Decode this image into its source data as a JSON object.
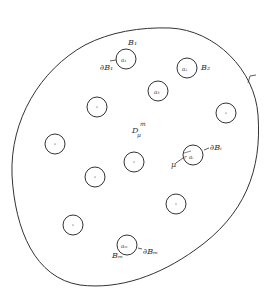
{
  "diagram": {
    "region_label": "D",
    "region_superscript": "m",
    "region_subscript": "μ",
    "boundary_label": "Γ",
    "inclusions": [
      {
        "id": "1",
        "cx": 126,
        "cy": 59,
        "center_label": "a₁",
        "ball_label": "B₁",
        "boundary_label": "∂B₁"
      },
      {
        "id": "2",
        "cx": 187,
        "cy": 68,
        "center_label": "a₂",
        "ball_label": "B₂"
      },
      {
        "id": "3",
        "cx": 158,
        "cy": 91,
        "center_label": "a₃"
      },
      {
        "id": "4",
        "cx": 97,
        "cy": 107
      },
      {
        "id": "5",
        "cx": 226,
        "cy": 113
      },
      {
        "id": "6",
        "cx": 55,
        "cy": 144
      },
      {
        "id": "7",
        "cx": 134,
        "cy": 162
      },
      {
        "id": "i",
        "cx": 193,
        "cy": 155,
        "center_label": "aᵢ",
        "radius_label": "r",
        "boundary_label": "∂Bᵢ",
        "param_label": "μ"
      },
      {
        "id": "8",
        "cx": 95,
        "cy": 177
      },
      {
        "id": "9",
        "cx": 176,
        "cy": 204
      },
      {
        "id": "10",
        "cx": 73,
        "cy": 225
      },
      {
        "id": "m",
        "cx": 127,
        "cy": 245,
        "center_label": "aₘ",
        "ball_label": "Bₘ",
        "boundary_label": "∂Bₘ"
      }
    ],
    "stroke_color": "#333333",
    "background": "#ffffff"
  }
}
